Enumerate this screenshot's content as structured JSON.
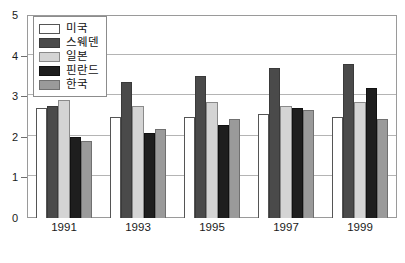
{
  "chart_data": {
    "type": "bar",
    "title": "",
    "subtitle": "",
    "xlabel": "",
    "ylabel": "",
    "categories": [
      "1991",
      "1993",
      "1995",
      "1997",
      "1999"
    ],
    "ylim": [
      0,
      5
    ],
    "y_ticks": [
      "0",
      "1",
      "2",
      "3",
      "4",
      "5"
    ],
    "y_tick_values": [
      0,
      1,
      2,
      3,
      4,
      5
    ],
    "grid": true,
    "grid_axis": "y",
    "legend_position": "top-left",
    "series": [
      {
        "name": "미국",
        "color": "#ffffff",
        "border": "#555555",
        "values": [
          2.7,
          2.5,
          2.5,
          2.55,
          2.5
        ]
      },
      {
        "name": "스웨덴",
        "color": "#4a4a4a",
        "border": "#3a3a3a",
        "values": [
          2.75,
          3.35,
          3.5,
          3.7,
          3.8
        ]
      },
      {
        "name": "일본",
        "color": "#d4d4d4",
        "border": "#8a8a8a",
        "values": [
          2.9,
          2.75,
          2.85,
          2.75,
          2.85
        ]
      },
      {
        "name": "핀란드",
        "color": "#1e1e1e",
        "border": "#111111",
        "values": [
          2.0,
          2.1,
          2.3,
          2.7,
          3.2
        ]
      },
      {
        "name": "한국",
        "color": "#9a9a9a",
        "border": "#707070",
        "values": [
          1.9,
          2.2,
          2.45,
          2.65,
          2.45
        ]
      }
    ]
  },
  "legend": {
    "items": [
      {
        "label": "미국"
      },
      {
        "label": "스웨덴"
      },
      {
        "label": "일본"
      },
      {
        "label": "핀란드"
      },
      {
        "label": "한국"
      }
    ]
  },
  "axes": {
    "y_labels": [
      "5",
      "4",
      "3",
      "2",
      "1",
      "0"
    ],
    "x_labels": [
      "1991",
      "1993",
      "1995",
      "1997",
      "1999"
    ]
  }
}
